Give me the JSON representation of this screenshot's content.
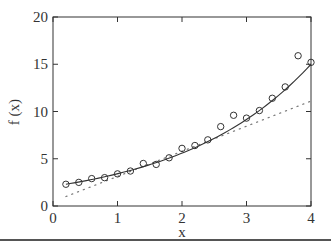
{
  "chart_data": {
    "type": "scatter",
    "title": "",
    "xlabel": "x",
    "ylabel": "f (x)",
    "xlim": [
      0,
      4
    ],
    "ylim": [
      0,
      20
    ],
    "xticks": [
      0,
      1,
      2,
      3,
      4
    ],
    "yticks": [
      0,
      5,
      10,
      15,
      20
    ],
    "grid": false,
    "legend": null,
    "series": [
      {
        "name": "data",
        "style": "open-circle markers",
        "x": [
          0.2,
          0.4,
          0.6,
          0.8,
          1.0,
          1.2,
          1.4,
          1.6,
          1.8,
          2.0,
          2.2,
          2.4,
          2.6,
          2.8,
          3.0,
          3.2,
          3.4,
          3.6,
          3.8,
          4.0
        ],
        "y": [
          2.3,
          2.5,
          2.9,
          3.0,
          3.4,
          3.7,
          4.5,
          4.4,
          5.1,
          6.1,
          6.4,
          7.0,
          8.4,
          9.6,
          9.3,
          10.1,
          11.4,
          12.6,
          15.9,
          15.2
        ]
      },
      {
        "name": "exponential fit",
        "style": "solid line",
        "x": [
          0.2,
          0.6,
          1.0,
          1.4,
          1.8,
          2.2,
          2.6,
          3.0,
          3.4,
          3.8,
          4.0
        ],
        "y": [
          2.3,
          2.8,
          3.4,
          4.2,
          5.1,
          6.2,
          7.5,
          9.2,
          11.1,
          13.6,
          15.0
        ]
      },
      {
        "name": "linear fit",
        "style": "dotted line",
        "x": [
          0.2,
          4.0
        ],
        "y": [
          1.0,
          11.1
        ]
      }
    ]
  },
  "labels": {
    "x_axis": "x",
    "y_axis": "f (x)",
    "xtick_labels": [
      "0",
      "1",
      "2",
      "3",
      "4"
    ],
    "ytick_labels": [
      "0",
      "5",
      "10",
      "15",
      "20"
    ]
  },
  "colors": {
    "axes": "#333333",
    "markers": "#333333",
    "fit_line": "#333333",
    "dotted_line": "#777777"
  }
}
